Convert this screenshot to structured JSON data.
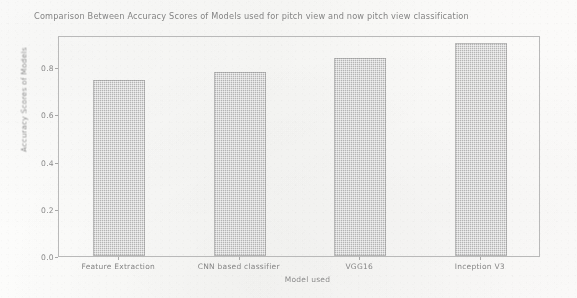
{
  "chart_data": {
    "type": "bar",
    "title": "Comparison Between Accuracy Scores of Models used for pitch view and now pitch view classification",
    "xlabel": "Model used",
    "ylabel": "Accuracy Scores of Models",
    "categories": [
      "Feature Extraction",
      "CNN based classifier",
      "VGG16",
      "Inception V3"
    ],
    "values": [
      0.745,
      0.78,
      0.84,
      0.9
    ],
    "ylim": [
      0.0,
      0.9
    ],
    "yticks": [
      0.0,
      0.2,
      0.4,
      0.6,
      0.8
    ],
    "ytick_labels": [
      "0.0",
      "0.2",
      "0.4",
      "0.6",
      "0.8"
    ],
    "grid": false,
    "legend": null,
    "bar_color": "#b0b0b0",
    "axis_color": "#b9b9b9",
    "text_color": "#858585"
  }
}
